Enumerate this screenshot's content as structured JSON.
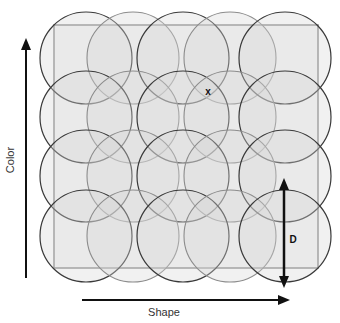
{
  "diagram": {
    "type": "overlapping-circle-coverage-grid",
    "axes": {
      "x": {
        "label": "Shape",
        "direction": "right"
      },
      "y": {
        "label": "Color",
        "direction": "up"
      }
    },
    "region": {
      "x": 54,
      "y": 25,
      "width": 264,
      "height": 243,
      "stroke": "#8a8a8a",
      "fill": "#f4f4f4"
    },
    "circles": {
      "radius": 46,
      "fill": "#d8d8d8",
      "fill_opacity": 0.35,
      "stroke_dark": "#3a3a3a",
      "stroke_light": "#8c8c8c",
      "columns_x": [
        86,
        133,
        183,
        230,
        285
      ],
      "rows_y": [
        58,
        117,
        176,
        236
      ],
      "count": 20
    },
    "marker": {
      "label": "x",
      "x": 208,
      "y": 95
    },
    "dimension": {
      "label": "D",
      "x": 284,
      "y1": 179,
      "y2": 287,
      "label_x": 293,
      "label_y": 242
    },
    "colors": {
      "arrow": "#111111",
      "text": "#333333"
    }
  }
}
